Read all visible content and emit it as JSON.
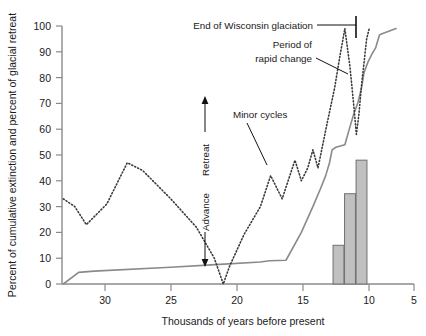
{
  "chart_data": {
    "type": "line",
    "title": "",
    "xlabel": "Thousands of years before present",
    "ylabel": "Percent of cumulative extinction and percent of glacial retreat",
    "xlim": [
      32.5,
      5
    ],
    "ylim": [
      0,
      100
    ],
    "x_ticks": [
      30,
      25,
      20,
      15,
      10,
      5
    ],
    "y_ticks": [
      0,
      10,
      20,
      30,
      40,
      50,
      60,
      70,
      80,
      90,
      100
    ],
    "x_reversed": true,
    "grid": false,
    "legend": "none",
    "series": [
      {
        "name": "Percent of cumulative extinction",
        "style": "solid",
        "color": "#8a8a8a",
        "points": [
          [
            32.4,
            0
          ],
          [
            31.2,
            4.5
          ],
          [
            30.0,
            5.0
          ],
          [
            24.0,
            6.5
          ],
          [
            20.5,
            7.5
          ],
          [
            17.0,
            8.5
          ],
          [
            16.3,
            9.0
          ],
          [
            15.0,
            9.2
          ],
          [
            13.8,
            20.0
          ],
          [
            12.9,
            30.0
          ],
          [
            12.3,
            37.0
          ],
          [
            11.9,
            42.0
          ],
          [
            11.6,
            47.0
          ],
          [
            11.4,
            52.0
          ],
          [
            11.1,
            53.0
          ],
          [
            10.4,
            54.0
          ],
          [
            10.0,
            61.0
          ],
          [
            9.7,
            66.0
          ],
          [
            9.4,
            70.0
          ],
          [
            9.1,
            76.0
          ],
          [
            8.9,
            82.0
          ],
          [
            8.6,
            86.0
          ],
          [
            8.3,
            89.0
          ],
          [
            8.0,
            91.5
          ],
          [
            7.7,
            96.5
          ],
          [
            7.5,
            97.0
          ],
          [
            6.4,
            99.0
          ]
        ]
      },
      {
        "name": "Percent of glacial retreat",
        "style": "dotted",
        "color": "#3a3a3a",
        "points": [
          [
            32.4,
            33
          ],
          [
            31.5,
            30
          ],
          [
            30.6,
            23
          ],
          [
            29.0,
            31
          ],
          [
            27.4,
            47
          ],
          [
            26.2,
            44
          ],
          [
            24.0,
            33
          ],
          [
            22.0,
            22
          ],
          [
            20.6,
            10
          ],
          [
            19.9,
            0
          ],
          [
            19.4,
            7
          ],
          [
            18.3,
            19
          ],
          [
            17.0,
            30
          ],
          [
            16.2,
            42
          ],
          [
            15.7,
            37
          ],
          [
            15.3,
            33
          ],
          [
            14.7,
            42
          ],
          [
            14.3,
            48
          ],
          [
            13.8,
            40
          ],
          [
            13.3,
            45
          ],
          [
            12.9,
            52
          ],
          [
            12.5,
            45
          ],
          [
            11.8,
            62
          ],
          [
            11.2,
            76
          ],
          [
            10.8,
            88
          ],
          [
            10.4,
            99
          ],
          [
            10.0,
            84
          ],
          [
            9.7,
            69
          ],
          [
            9.5,
            58
          ],
          [
            9.3,
            66
          ],
          [
            9.1,
            77
          ],
          [
            8.9,
            86
          ],
          [
            8.7,
            95
          ],
          [
            8.5,
            99
          ]
        ]
      }
    ],
    "bars": {
      "name": "Extinction events",
      "color": "#c0c0c0",
      "edge_color": "#707070",
      "items": [
        {
          "x": 10.9,
          "value": 15,
          "width": 0.85
        },
        {
          "x": 10.0,
          "value": 35,
          "width": 0.85
        },
        {
          "x": 9.1,
          "value": 48,
          "width": 0.85
        }
      ]
    },
    "annotations": [
      {
        "name": "end-of-wisconsin-glaciation",
        "text": "End of Wisconsin glaciation",
        "x": 10.3,
        "y": 100
      },
      {
        "name": "period-of-rapid-change",
        "text_line1": "Period of",
        "text_line2": "rapid change",
        "x": 11.5,
        "y": 84
      },
      {
        "name": "minor-cycles",
        "text": "Minor cycles",
        "x": 14.5,
        "y": 62
      }
    ],
    "axis_arrow": {
      "up_label": "Retreat",
      "down_label": "Advance"
    }
  }
}
